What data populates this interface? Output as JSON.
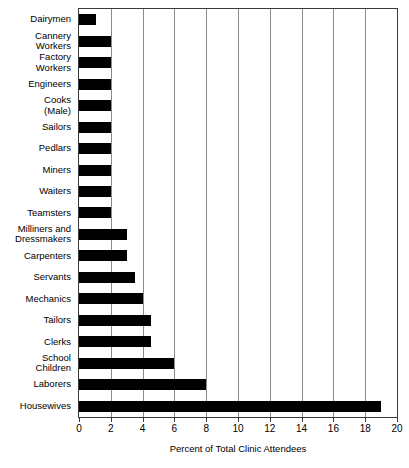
{
  "chart_data": {
    "type": "bar",
    "orientation": "horizontal",
    "title": "",
    "xlabel": "Percent of Total Clinic Attendees",
    "ylabel": "",
    "xlim": [
      0,
      20
    ],
    "xticks": [
      0,
      2,
      4,
      6,
      8,
      10,
      12,
      14,
      16,
      18,
      20
    ],
    "grid": "vertical",
    "legend": "none",
    "bar_color": "#000000",
    "categories": [
      "Dairymen",
      "Cannery\nWorkers",
      "Factory\nWorkers",
      "Engineers",
      "Cooks\n(Male)",
      "Sailors",
      "Pedlars",
      "Miners",
      "Waiters",
      "Teamsters",
      "Milliners and\nDressmakers",
      "Carpenters",
      "Servants",
      "Mechanics",
      "Tailors",
      "Clerks",
      "School\nChildren",
      "Laborers",
      "Housewives"
    ],
    "values": [
      1.1,
      2.0,
      2.0,
      2.0,
      2.0,
      2.0,
      2.0,
      2.0,
      2.0,
      2.0,
      3.0,
      3.0,
      3.5,
      4.0,
      4.5,
      4.5,
      6.0,
      8.0,
      19.0
    ]
  }
}
